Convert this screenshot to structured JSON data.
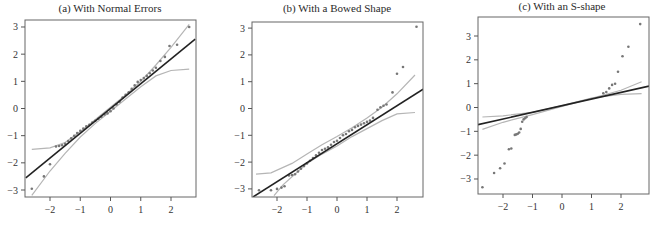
{
  "chart_data": [
    {
      "type": "scatter",
      "title": "(a) With Normal Errors",
      "xlabel": "",
      "ylabel": "",
      "xlim": [
        -2.8,
        2.8
      ],
      "ylim": [
        -3.2,
        3.3
      ],
      "xticks": [
        -2,
        -1,
        0,
        1,
        2
      ],
      "yticks": [
        -3,
        -2,
        -1,
        0,
        1,
        2,
        3
      ],
      "grid": false,
      "frame": {
        "x0": 25,
        "y0": 20,
        "x1": 196,
        "y1": 197
      },
      "scale": {
        "px_per_x": 30.25,
        "x_origin": 110.5,
        "px_per_y": 27.17,
        "y_origin": 108.5
      },
      "fit_line": {
        "x": [
          -2.8,
          2.8
        ],
        "y": [
          -2.55,
          2.55
        ]
      },
      "band_upper": {
        "x": [
          -2.6,
          -2.0,
          -1.5,
          -1.0,
          -0.5,
          0,
          0.5,
          1.0,
          1.5,
          2.0,
          2.6
        ],
        "y": [
          -1.5,
          -1.45,
          -1.25,
          -0.85,
          -0.4,
          0.05,
          0.5,
          1.0,
          1.6,
          2.25,
          3.1
        ]
      },
      "band_lower": {
        "x": [
          -2.6,
          -2.0,
          -1.5,
          -1.0,
          -0.5,
          0,
          0.5,
          1.0,
          1.5,
          2.0,
          2.6
        ],
        "y": [
          -3.2,
          -2.3,
          -1.65,
          -1.05,
          -0.55,
          -0.1,
          0.35,
          0.8,
          1.2,
          1.4,
          1.45
        ]
      },
      "points": {
        "x": [
          -2.6,
          -2.2,
          -2.0,
          -1.8,
          -1.7,
          -1.6,
          -1.5,
          -1.4,
          -1.3,
          -1.2,
          -1.1,
          -1.0,
          -0.9,
          -0.8,
          -0.7,
          -0.6,
          -0.5,
          -0.4,
          -0.3,
          -0.2,
          -0.1,
          0.0,
          0.1,
          0.2,
          0.3,
          0.4,
          0.5,
          0.6,
          0.7,
          0.8,
          0.9,
          1.0,
          1.1,
          1.2,
          1.3,
          1.4,
          1.5,
          1.65,
          1.8,
          1.95,
          2.2,
          2.6
        ],
        "y": [
          -2.95,
          -2.5,
          -2.05,
          -1.4,
          -1.38,
          -1.35,
          -1.3,
          -1.2,
          -1.1,
          -1.0,
          -0.9,
          -0.82,
          -0.74,
          -0.66,
          -0.6,
          -0.52,
          -0.45,
          -0.38,
          -0.3,
          -0.22,
          -0.18,
          -0.1,
          0.0,
          0.15,
          0.25,
          0.4,
          0.5,
          0.6,
          0.72,
          0.85,
          0.98,
          1.05,
          1.12,
          1.2,
          1.3,
          1.4,
          1.5,
          1.75,
          1.9,
          2.3,
          2.35,
          3.0
        ]
      }
    },
    {
      "type": "scatter",
      "title": "(b) With a Bowed Shape",
      "xlabel": "",
      "ylabel": "",
      "xlim": [
        -2.8,
        2.9
      ],
      "ylim": [
        -3.3,
        3.2
      ],
      "xticks": [
        -2,
        -1,
        0,
        1,
        2
      ],
      "yticks": [
        -3,
        -2,
        -1,
        0,
        1,
        2,
        3
      ],
      "grid": false,
      "frame": {
        "x0": 252,
        "y0": 22,
        "x1": 423,
        "y1": 197
      },
      "scale": {
        "px_per_x": 30.0,
        "x_origin": 337.0,
        "px_per_y": 26.8,
        "y_origin": 108.5
      },
      "fit_line": {
        "x": [
          -2.8,
          2.87
        ],
        "y": [
          -3.3,
          0.72
        ]
      },
      "band_upper": {
        "x": [
          -2.7,
          -2.2,
          -1.5,
          -1.0,
          -0.5,
          0,
          0.5,
          1.0,
          1.5,
          2.0,
          2.6
        ],
        "y": [
          -2.45,
          -2.4,
          -2.05,
          -1.7,
          -1.35,
          -1.05,
          -0.72,
          -0.35,
          0.05,
          0.55,
          1.25
        ]
      },
      "band_lower": {
        "x": [
          -2.1,
          -1.8,
          -1.5,
          -1.0,
          -0.5,
          0,
          0.5,
          1.0,
          1.5,
          2.0,
          2.6
        ],
        "y": [
          -3.25,
          -2.85,
          -2.55,
          -2.05,
          -1.7,
          -1.4,
          -1.05,
          -0.75,
          -0.45,
          -0.2,
          -0.15
        ]
      },
      "points": {
        "x": [
          -2.6,
          -2.2,
          -2.0,
          -1.85,
          -1.75,
          -1.6,
          -1.5,
          -1.4,
          -1.3,
          -1.2,
          -1.1,
          -1.0,
          -0.9,
          -0.8,
          -0.7,
          -0.6,
          -0.5,
          -0.4,
          -0.3,
          -0.2,
          -0.1,
          0.0,
          0.1,
          0.2,
          0.3,
          0.4,
          0.5,
          0.6,
          0.7,
          0.8,
          0.9,
          1.0,
          1.1,
          1.2,
          1.35,
          1.45,
          1.55,
          1.65,
          1.85,
          2.0,
          2.2,
          2.65
        ],
        "y": [
          -3.05,
          -3.05,
          -3.0,
          -2.95,
          -2.9,
          -2.5,
          -2.48,
          -2.45,
          -2.35,
          -2.25,
          -2.15,
          -2.05,
          -1.95,
          -1.85,
          -1.75,
          -1.65,
          -1.55,
          -1.5,
          -1.45,
          -1.35,
          -1.25,
          -1.2,
          -1.1,
          -1.0,
          -0.95,
          -0.85,
          -0.8,
          -0.7,
          -0.65,
          -0.6,
          -0.55,
          -0.5,
          -0.45,
          -0.35,
          -0.05,
          0.05,
          0.1,
          0.15,
          0.6,
          1.3,
          1.55,
          3.05
        ]
      }
    },
    {
      "type": "scatter",
      "title": "(c) With an S-shape",
      "xlabel": "",
      "ylabel": "",
      "xlim": [
        -2.85,
        2.95
      ],
      "ylim": [
        -3.65,
        3.8
      ],
      "xticks": [
        -2,
        -1,
        0,
        1,
        2
      ],
      "yticks": [
        -3,
        -2,
        -1,
        0,
        1,
        2,
        3
      ],
      "grid": false,
      "frame": {
        "x0": 478,
        "y0": 17,
        "x1": 649,
        "y1": 194
      },
      "scale": {
        "px_per_x": 29.5,
        "x_origin": 562.0,
        "px_per_y": 23.83,
        "y_origin": 107.5
      },
      "fit_line": {
        "x": [
          -2.85,
          2.95
        ],
        "y": [
          -0.72,
          0.9
        ]
      },
      "band_upper": {
        "x": [
          -2.7,
          -2.0,
          -1.0,
          0,
          1.0,
          2.0,
          2.7
        ],
        "y": [
          -0.4,
          -0.35,
          -0.2,
          0.08,
          0.4,
          0.55,
          0.58
        ]
      },
      "band_lower": {
        "x": [
          -2.7,
          -2.0,
          -1.0,
          0,
          1.0,
          2.0,
          2.7
        ],
        "y": [
          -0.92,
          -0.62,
          -0.3,
          0.05,
          0.38,
          0.72,
          1.08
        ]
      },
      "points": {
        "x": [
          -2.7,
          -2.3,
          -2.1,
          -1.95,
          -1.8,
          -1.72,
          -1.6,
          -1.55,
          -1.5,
          -1.45,
          -1.4,
          -1.35,
          -1.3,
          -1.25,
          -1.2,
          1.4,
          1.5,
          1.6,
          1.7,
          1.8,
          1.9,
          2.05,
          2.25,
          2.65
        ],
        "y": [
          -3.35,
          -2.75,
          -2.55,
          -2.35,
          -1.75,
          -1.72,
          -1.15,
          -1.13,
          -1.1,
          -1.05,
          -0.9,
          -0.6,
          -0.5,
          -0.45,
          -0.4,
          0.6,
          0.65,
          0.8,
          0.95,
          1.0,
          1.5,
          2.15,
          2.55,
          3.5
        ]
      }
    }
  ]
}
